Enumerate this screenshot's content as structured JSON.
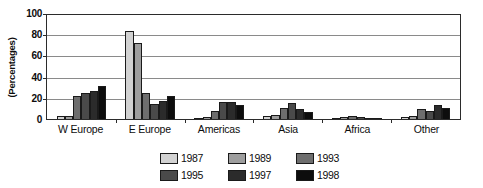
{
  "chart_data": {
    "type": "bar",
    "title": "",
    "xlabel": "",
    "ylabel": "(Percentages)",
    "ylim": [
      0,
      100
    ],
    "yticks": [
      0,
      20,
      40,
      60,
      80,
      100
    ],
    "grid": true,
    "legend_position": "bottom",
    "categories": [
      "W Europe",
      "E Europe",
      "Americas",
      "Asia",
      "Africa",
      "Other"
    ],
    "series": [
      {
        "name": "1987",
        "color": "#d2d2d2",
        "values": [
          3,
          83,
          1,
          3,
          1,
          2
        ]
      },
      {
        "name": "1989",
        "color": "#9e9e9e",
        "values": [
          3,
          72,
          2,
          4,
          2,
          3
        ]
      },
      {
        "name": "1993",
        "color": "#6e6e6e",
        "values": [
          22,
          25,
          8,
          10,
          3,
          9.5
        ]
      },
      {
        "name": "1995",
        "color": "#4a4a4a",
        "values": [
          25,
          14,
          16.5,
          15,
          2,
          8
        ]
      },
      {
        "name": "1997",
        "color": "#2b2b2b",
        "values": [
          26,
          17,
          16,
          9,
          1,
          13
        ]
      },
      {
        "name": "1998",
        "color": "#0d0d0d",
        "values": [
          31,
          22,
          13,
          6.5,
          0.5,
          10.5
        ]
      }
    ]
  },
  "axis": {
    "y_title": "(Percentages)"
  }
}
